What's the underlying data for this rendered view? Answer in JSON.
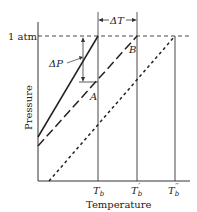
{
  "diagram": {
    "axes": {
      "xlabel": "Temperature",
      "ylabel": "Pressure",
      "pressure_level_label": "1 atm"
    },
    "x_ticks": [
      {
        "label_main": "T",
        "label_sub": "b",
        "label_prime": ""
      },
      {
        "label_main": "T",
        "label_sub": "b",
        "label_prime": "′"
      },
      {
        "label_main": "T",
        "label_sub": "b",
        "label_prime": "′′"
      }
    ],
    "curves": [
      {
        "name": "pure solvent",
        "style": "solid"
      },
      {
        "name": "solution",
        "style": "long-dashed"
      },
      {
        "name": "more concentrated solution",
        "style": "short-dashed"
      }
    ],
    "annotations": {
      "delta_p": "ΔP",
      "delta_t": "ΔT",
      "point_a": "A",
      "point_b": "B"
    }
  }
}
